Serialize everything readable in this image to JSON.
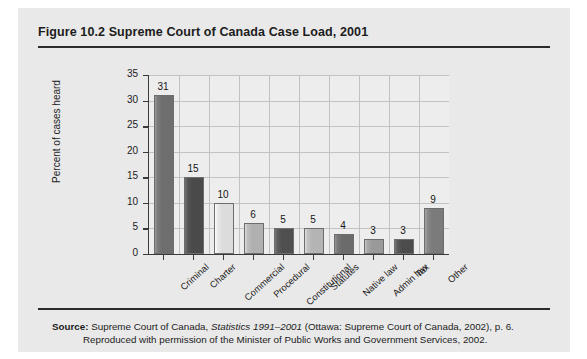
{
  "figure": {
    "title": "Figure 10.2  Supreme Court of Canada Case Load, 2001",
    "source_label": "Source:",
    "source_text_1": " Supreme Court of Canada, ",
    "source_italic": "Statistics 1991–2001",
    "source_text_2": " (Ottawa: Supreme Court of Canada, 2002), p. 6.",
    "source_line2": "Reproduced with permission of the Minister of Public Works and Government Services, 2002."
  },
  "colors": {
    "panel_background": "#e9e9e9",
    "plot_background": "#ededed",
    "axis": "#3a3a3a",
    "gridline": "#c2c2c2",
    "text": "#1c1c1c"
  },
  "chart_data": {
    "type": "bar",
    "title": "Supreme Court of Canada Case Load, 2001",
    "xlabel": "",
    "ylabel": "Percent of cases heard",
    "ylim": [
      0,
      35
    ],
    "ytick_step": 5,
    "yticks": [
      "0",
      "5",
      "10",
      "15",
      "20",
      "25",
      "30",
      "35"
    ],
    "grid": "both",
    "legend": "none",
    "categories": [
      "Criminal",
      "Charter",
      "Commercial",
      "Procedural",
      "Constitutional",
      "Statutes",
      "Native law",
      "Admin law",
      "Tax",
      "Other"
    ],
    "values": [
      31,
      15,
      10,
      6,
      5,
      5,
      4,
      3,
      3,
      9
    ],
    "value_labels": [
      "31",
      "15",
      "10",
      "6",
      "5",
      "5",
      "4",
      "3",
      "3",
      "9"
    ],
    "bar_colors": [
      "#6e6e6e",
      "#4a4a4a",
      "#dcdcdc",
      "#b0b0b0",
      "#4f4f4f",
      "#b4b4b4",
      "#6b6b6b",
      "#9a9a9a",
      "#4c4c4c",
      "#7b7b7b"
    ]
  }
}
